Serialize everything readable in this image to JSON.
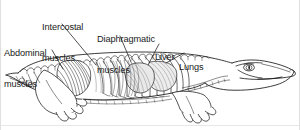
{
  "figure": {
    "view": "lateral cutaway",
    "background_color": "#ffffff",
    "ink_color": "#1a1a1a",
    "border_color": "#c8c8c8"
  },
  "labels": [
    {
      "id": "abdominal-muscles",
      "line1": "Abdominal",
      "line2": "muscles",
      "x": 4,
      "y": 28
    },
    {
      "id": "intercostal-muscles",
      "line1": "Intercostal",
      "line2": "muscles",
      "x": 42,
      "y": 2
    },
    {
      "id": "diaphragmatic-muscles",
      "line1": "Diaphragmatic",
      "line2": "muscles",
      "x": 97,
      "y": 14
    },
    {
      "id": "liver",
      "line1": "Liver",
      "line2": "",
      "x": 155,
      "y": 32
    },
    {
      "id": "lungs",
      "line1": "Lungs",
      "line2": "",
      "x": 179,
      "y": 42
    }
  ],
  "leader_lines": [
    {
      "id": "leader-abdominal",
      "points": "52,50 63,69"
    },
    {
      "id": "leader-intercostal",
      "points": "62,24 95,64"
    },
    {
      "id": "leader-diaphragmatic",
      "points": "120,36 131,62"
    },
    {
      "id": "leader-liver",
      "points": "159,44 150,63"
    },
    {
      "id": "leader-lungs",
      "points": "183,53 165,63"
    }
  ],
  "anatomy_parts": [
    {
      "id": "body-outline",
      "label": "alligator body outline"
    },
    {
      "id": "head",
      "label": "head and snout"
    },
    {
      "id": "eye",
      "label": "eye"
    },
    {
      "id": "tail",
      "label": "tail"
    },
    {
      "id": "dorsal-scutes",
      "label": "dorsal osteoderm scutes"
    },
    {
      "id": "ventral-scales",
      "label": "ventral belly scales"
    },
    {
      "id": "forelimb",
      "label": "forelimb"
    },
    {
      "id": "hindlimb",
      "label": "hindlimb"
    },
    {
      "id": "rib-cage",
      "label": "rib cage"
    },
    {
      "id": "lung-mass",
      "label": "lungs shading"
    },
    {
      "id": "liver-mass",
      "label": "liver shading"
    },
    {
      "id": "diaphragmatic-muscle-fan",
      "label": "diaphragmatic muscle fan"
    },
    {
      "id": "abdominal-muscle-hatching",
      "label": "abdominal muscle hatching"
    }
  ]
}
